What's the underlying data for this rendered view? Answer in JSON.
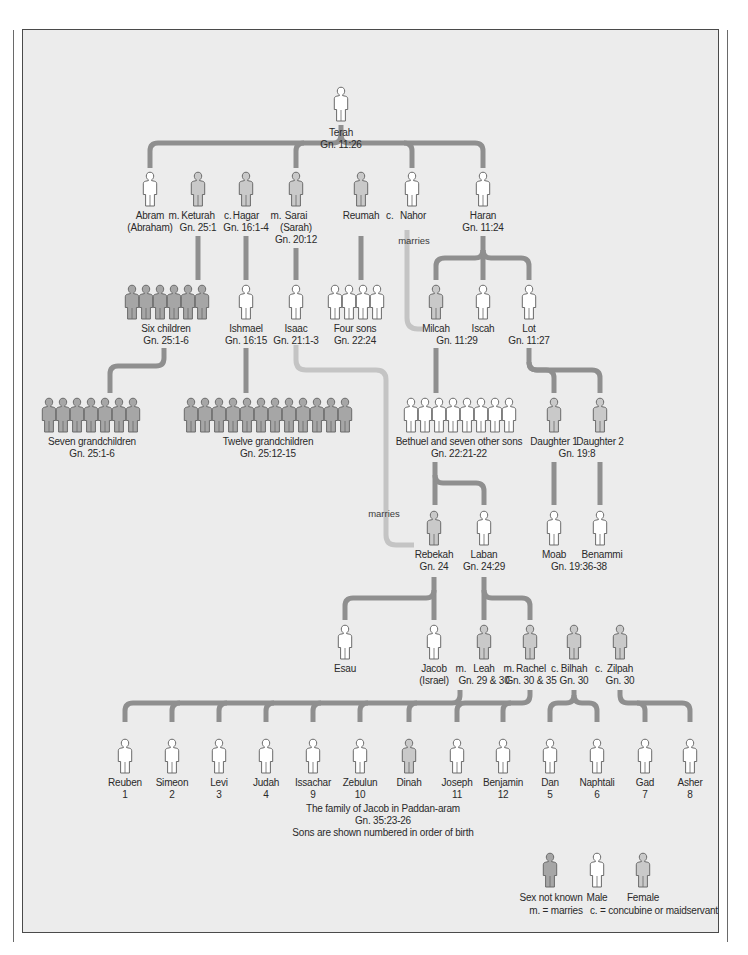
{
  "colors": {
    "panel_bg": "#ececec",
    "blood_line": "#8f8f8f",
    "marriage_line": "#c4c4c4",
    "male_fill": "#ffffff",
    "female_fill": "#c9c9c9",
    "unknown_fill": "#a6a6a6",
    "figure_stroke": "#6a6a6a"
  },
  "people": {
    "terah": {
      "name": "Terah",
      "ref": "Gn. 11:26",
      "sex": "male"
    },
    "abram": {
      "name": "Abram",
      "ref": "(Abraham)",
      "sex": "male"
    },
    "keturah": {
      "name": "Keturah",
      "ref": "Gn. 25:1",
      "sex": "female"
    },
    "hagar": {
      "name": "Hagar",
      "ref": "Gn. 16:1-4",
      "sex": "female"
    },
    "sarai": {
      "name": "Sarai",
      "ref": "(Sarah)",
      "ref2": "Gn. 20:12",
      "sex": "female"
    },
    "reumah": {
      "name": "Reumah",
      "sex": "female"
    },
    "nahor": {
      "name": "Nahor",
      "sex": "male"
    },
    "haran": {
      "name": "Haran",
      "ref": "Gn. 11:24",
      "sex": "male"
    },
    "six_children": {
      "name": "Six children",
      "ref": "Gn. 25:1-6",
      "sex": "unknown",
      "count": 6
    },
    "ishmael": {
      "name": "Ishmael",
      "ref": "Gn. 16:15",
      "sex": "male"
    },
    "isaac": {
      "name": "Isaac",
      "ref": "Gn. 21:1-3",
      "sex": "male"
    },
    "four_sons": {
      "name": "Four sons",
      "ref": "Gn. 22:24",
      "sex": "male",
      "count": 4
    },
    "milcah": {
      "name": "Milcah",
      "ref": "Gn. 11:29",
      "sex": "female"
    },
    "iscah": {
      "name": "Iscah",
      "sex": "male"
    },
    "lot": {
      "name": "Lot",
      "ref": "Gn. 11:27",
      "sex": "male"
    },
    "seven_grandchildren": {
      "name": "Seven grandchildren",
      "ref": "Gn. 25:1-6",
      "sex": "unknown",
      "count": 7
    },
    "twelve_grandchildren": {
      "name": "Twelve grandchildren",
      "ref": "Gn. 25:12-15",
      "sex": "unknown",
      "count": 12
    },
    "bethuel": {
      "name": "Bethuel and seven other sons",
      "ref": "Gn. 22:21-22",
      "sex": "male",
      "count": 8
    },
    "daughter1": {
      "name": "Daughter 1",
      "sex": "female"
    },
    "daughter2": {
      "name": "Daughter 2",
      "sex": "female"
    },
    "daughters_ref": "Gn. 19:8",
    "rebekah": {
      "name": "Rebekah",
      "ref": "Gn. 24",
      "sex": "female"
    },
    "laban": {
      "name": "Laban",
      "ref": "Gn. 24:29",
      "sex": "male"
    },
    "moab": {
      "name": "Moab",
      "sex": "male"
    },
    "benammi": {
      "name": "Benammi",
      "sex": "male"
    },
    "moab_ref": "Gn. 19:36-38",
    "esau": {
      "name": "Esau",
      "sex": "male"
    },
    "jacob": {
      "name": "Jacob",
      "ref": "(Israel)",
      "sex": "male"
    },
    "leah": {
      "name": "Leah",
      "ref": "Gn. 29 & 30",
      "sex": "female"
    },
    "rachel": {
      "name": "Rachel",
      "ref": "Gn. 30 & 35",
      "sex": "female"
    },
    "bilhah": {
      "name": "Bilhah",
      "ref": "Gn. 30",
      "sex": "female"
    },
    "zilpah": {
      "name": "Zilpah",
      "ref": "Gn. 30",
      "sex": "female"
    }
  },
  "relations": {
    "abram_keturah": "m.",
    "keturah_hagar": "c.",
    "hagar_sarai": "m.",
    "reumah_nahor": "c.",
    "jacob_leah": "m.",
    "leah_rachel": "m.",
    "rachel_bilhah": "c.",
    "bilhah_zilpah": "c.",
    "marries_1": "marries",
    "marries_2": "marries"
  },
  "sons_of_jacob": [
    {
      "name": "Reuben",
      "order": "1",
      "sex": "male"
    },
    {
      "name": "Simeon",
      "order": "2",
      "sex": "male"
    },
    {
      "name": "Levi",
      "order": "3",
      "sex": "male"
    },
    {
      "name": "Judah",
      "order": "4",
      "sex": "male"
    },
    {
      "name": "Issachar",
      "order": "9",
      "sex": "male"
    },
    {
      "name": "Zebulun",
      "order": "10",
      "sex": "male"
    },
    {
      "name": "Dinah",
      "order": "",
      "sex": "female"
    },
    {
      "name": "Joseph",
      "order": "11",
      "sex": "male"
    },
    {
      "name": "Benjamin",
      "order": "12",
      "sex": "male"
    },
    {
      "name": "Dan",
      "order": "5",
      "sex": "male"
    },
    {
      "name": "Naphtali",
      "order": "6",
      "sex": "male"
    },
    {
      "name": "Gad",
      "order": "7",
      "sex": "male"
    },
    {
      "name": "Asher",
      "order": "8",
      "sex": "male"
    }
  ],
  "caption": {
    "line1": "The family of Jacob in Paddan-aram",
    "line2": "Gn. 35:23-26",
    "line3": "Sons are shown numbered in order of birth"
  },
  "legend": {
    "unknown": "Sex not known",
    "male": "Male",
    "female": "Female",
    "m_key": "m. = marries",
    "c_key": "c. = concubine or maidservant"
  }
}
